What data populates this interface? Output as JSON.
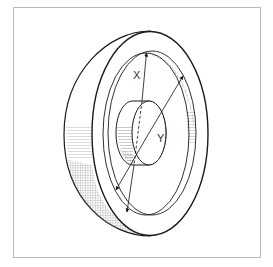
{
  "diagram": {
    "labels": {
      "x": "X",
      "y": "Y"
    },
    "colors": {
      "frame": "#b8b8b8",
      "outline": "#1a1a1a",
      "hatch": "#555555",
      "background": "#ffffff"
    }
  }
}
